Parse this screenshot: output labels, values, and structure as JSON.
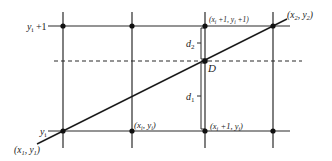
{
  "diagram": {
    "title": "",
    "colors": {
      "line": "#2a2a2a",
      "text": "#222222",
      "background": "#ffffff"
    },
    "labels": {
      "y_top": "y_i + 1",
      "y_bottom": "y_i",
      "start_point": "(x_1, y_1)",
      "end_point": "(x_2, y_2)",
      "top_pixel": "(x_i + 1, y_i + 1)",
      "bottom_left_pixel": "(x_i, y_i)",
      "bottom_right_pixel": "(x_i + 1, y_i)",
      "distance_upper": "d_2",
      "distance_lower": "d_1",
      "intersection": "D"
    },
    "parts": {
      "y_top": {
        "main": "y",
        "sub": "i",
        "rest": " +1"
      },
      "y_bottom": {
        "main": "y",
        "sub": "i"
      },
      "start_point": {
        "open": "(x",
        "sub1": "1",
        "mid": ", y",
        "sub2": "1",
        "close": ")"
      },
      "end_point": {
        "open": "(x",
        "sub1": "2",
        "mid": ", y",
        "sub2": "2",
        "close": ")"
      },
      "top_pixel": {
        "open": "(x",
        "sub1": "i",
        "mid": " +1, y",
        "sub2": "i",
        "close": " +1)"
      },
      "bottom_left_pixel": {
        "open": "(x",
        "sub1": "i",
        "mid": ", y",
        "sub2": "i",
        "close": ")"
      },
      "bottom_right_pixel": {
        "open": "(x",
        "sub1": "i",
        "mid": " +1, y",
        "sub2": "i",
        "close": ")"
      },
      "d2": {
        "main": "d",
        "sub": "2"
      },
      "d1": {
        "main": "d",
        "sub": "1"
      },
      "D": "D"
    }
  }
}
